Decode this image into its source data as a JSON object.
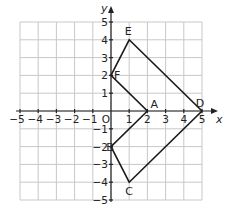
{
  "diagram": {
    "type": "coordinate-plane",
    "x_axis_label": "x",
    "y_axis_label": "y",
    "origin_label": "O",
    "x_range": [
      -5,
      5
    ],
    "y_range": [
      -5,
      5
    ],
    "x_ticks": [
      "−5",
      "−4",
      "−3",
      "−2",
      "−1",
      "1",
      "2",
      "3",
      "4",
      "5"
    ],
    "y_ticks": [
      "5",
      "4",
      "3",
      "2",
      "1",
      "−1",
      "−2",
      "−3",
      "−4",
      "−5"
    ],
    "points": [
      {
        "label": "A",
        "x": 2,
        "y": 0
      },
      {
        "label": "B",
        "x": 0,
        "y": -2
      },
      {
        "label": "C",
        "x": 1,
        "y": -4
      },
      {
        "label": "D",
        "x": 5,
        "y": 0
      },
      {
        "label": "E",
        "x": 1,
        "y": 4
      },
      {
        "label": "F",
        "x": 0,
        "y": 2
      }
    ],
    "polygon_order": [
      "A",
      "B",
      "C",
      "D",
      "E",
      "F"
    ],
    "colors": {
      "grid": "#c8c8c8",
      "axis": "#222222",
      "shape": "#1a1a1a"
    }
  }
}
